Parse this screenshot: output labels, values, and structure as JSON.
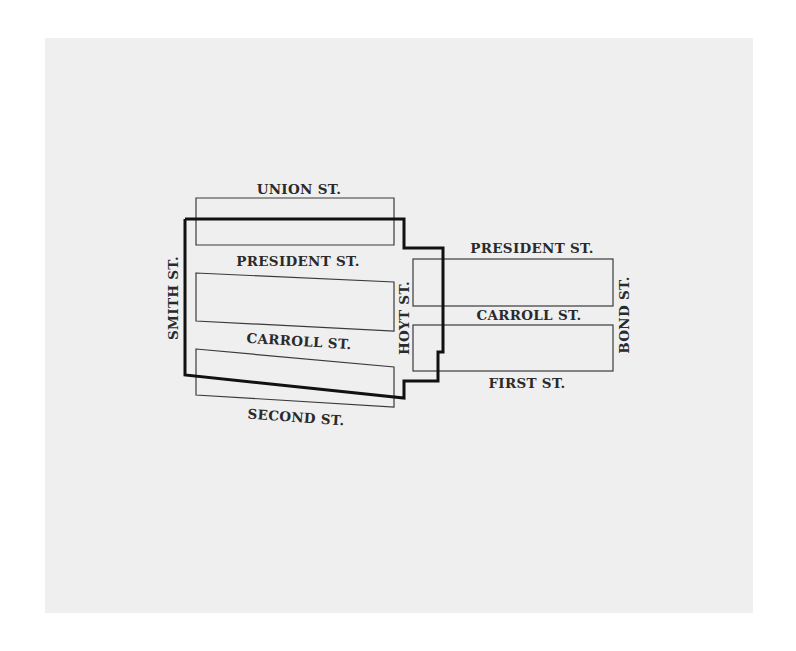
{
  "map": {
    "type": "street-map",
    "background": "#efefef",
    "boundary_color": "#111111",
    "block_outline_color": "#3a3a3a",
    "label_color": "#2a2a2a",
    "streets": {
      "union": "UNION ST.",
      "president_west": "PRESIDENT ST.",
      "carroll_west": "CARROLL ST.",
      "second": "SECOND ST.",
      "smith": "SMITH ST.",
      "hoyt": "HOYT ST.",
      "president_east": "PRESIDENT ST.",
      "carroll_east": "CARROLL ST.",
      "first": "FIRST ST.",
      "bond": "BOND ST."
    },
    "blocks": [
      {
        "id": "block-union-president-west",
        "between": [
          "UNION ST.",
          "PRESIDENT ST."
        ],
        "side": "west of Hoyt"
      },
      {
        "id": "block-president-carroll-west",
        "between": [
          "PRESIDENT ST.",
          "CARROLL ST."
        ],
        "side": "west of Hoyt"
      },
      {
        "id": "block-carroll-second-west",
        "between": [
          "CARROLL ST.",
          "SECOND ST."
        ],
        "side": "west of Hoyt"
      },
      {
        "id": "block-president-carroll-east",
        "between": [
          "PRESIDENT ST.",
          "CARROLL ST."
        ],
        "side": "between Hoyt and Bond"
      },
      {
        "id": "block-carroll-first-east",
        "between": [
          "CARROLL ST.",
          "FIRST ST."
        ],
        "side": "between Hoyt and Bond"
      }
    ],
    "district_boundary": "thick outline"
  }
}
